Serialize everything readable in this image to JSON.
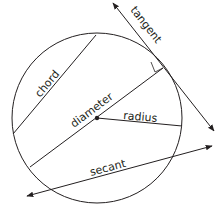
{
  "diagram": {
    "colors": {
      "stroke": "#231f20",
      "background": "#ffffff"
    },
    "labels": {
      "tangent": "tangent",
      "chord": "chord",
      "diameter": "diameter",
      "radius": "radius",
      "secant": "secant"
    },
    "elements": [
      {
        "name": "circle",
        "center": [
          97,
          118
        ],
        "r": 85
      },
      {
        "name": "tangent",
        "from": [
          113,
          3
        ],
        "to": [
          214,
          131
        ],
        "arrows": "both"
      },
      {
        "name": "chord",
        "from": [
          13,
          134
        ],
        "to": [
          96,
          35
        ]
      },
      {
        "name": "diameter",
        "from": [
          30,
          167
        ],
        "to": [
          163,
          68
        ]
      },
      {
        "name": "radius",
        "from": [
          97,
          118
        ],
        "to": [
          182,
          126
        ]
      },
      {
        "name": "secant",
        "from": [
          27,
          196
        ],
        "to": [
          212,
          146
        ],
        "arrows": "both"
      },
      {
        "name": "center-point",
        "at": [
          97,
          118
        ]
      },
      {
        "name": "right-angle-marker",
        "at": [
          163,
          68
        ]
      }
    ]
  }
}
